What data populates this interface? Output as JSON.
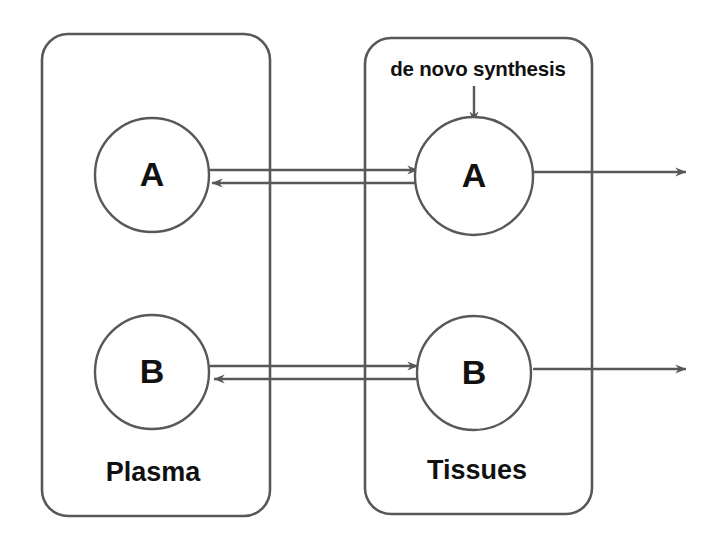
{
  "diagram": {
    "type": "two-compartment-flow-diagram",
    "background_color": "#ffffff",
    "stroke_color": "#585858",
    "text_color": "#111111",
    "compartments": [
      {
        "id": "plasma",
        "label": "Plasma",
        "nodes": [
          {
            "id": "plasma-a",
            "label": "A"
          },
          {
            "id": "plasma-b",
            "label": "B"
          }
        ]
      },
      {
        "id": "tissues",
        "label": "Tissues",
        "nodes": [
          {
            "id": "tissues-a",
            "label": "A"
          },
          {
            "id": "tissues-b",
            "label": "B"
          }
        ]
      }
    ],
    "annotations": [
      {
        "id": "de-novo-synthesis",
        "label": "de novo  synthesis"
      }
    ],
    "flows": [
      {
        "id": "flow-a-plasma-to-tissues",
        "from": "plasma-a",
        "to": "tissues-a",
        "direction": "right"
      },
      {
        "id": "flow-a-tissues-to-plasma",
        "from": "tissues-a",
        "to": "plasma-a",
        "direction": "left"
      },
      {
        "id": "flow-b-plasma-to-tissues",
        "from": "plasma-b",
        "to": "tissues-b",
        "direction": "right"
      },
      {
        "id": "flow-b-tissues-to-plasma",
        "from": "tissues-b",
        "to": "plasma-b",
        "direction": "left"
      },
      {
        "id": "flow-a-elimination",
        "from": "tissues-a",
        "to": "external",
        "direction": "right"
      },
      {
        "id": "flow-b-elimination",
        "from": "tissues-b",
        "to": "external",
        "direction": "right"
      },
      {
        "id": "flow-de-novo-synthesis",
        "from": "de-novo-synthesis",
        "to": "tissues-a",
        "direction": "down"
      }
    ]
  }
}
